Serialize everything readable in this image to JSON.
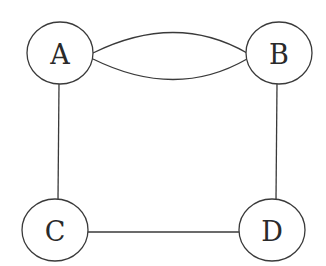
{
  "diagram": {
    "type": "multigraph",
    "nodes": [
      {
        "id": "A",
        "label": "A",
        "cx": 60,
        "cy": 53,
        "rx": 33,
        "ry": 31
      },
      {
        "id": "B",
        "label": "B",
        "cx": 279,
        "cy": 53,
        "rx": 33,
        "ry": 31
      },
      {
        "id": "C",
        "label": "C",
        "cx": 55,
        "cy": 230,
        "rx": 33,
        "ry": 31
      },
      {
        "id": "D",
        "label": "D",
        "cx": 272,
        "cy": 230,
        "rx": 33,
        "ry": 31
      }
    ],
    "edges": [
      {
        "from": "A",
        "to": "B",
        "shape": "upper-arc"
      },
      {
        "from": "A",
        "to": "B",
        "shape": "lower-arc"
      },
      {
        "from": "A",
        "to": "C",
        "shape": "straight"
      },
      {
        "from": "B",
        "to": "D",
        "shape": "straight"
      },
      {
        "from": "C",
        "to": "D",
        "shape": "straight"
      }
    ],
    "colors": {
      "stroke": "#3a3a3a",
      "background": "#ffffff"
    }
  }
}
